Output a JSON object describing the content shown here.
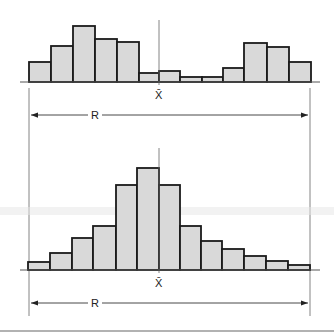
{
  "chart_data": [
    {
      "type": "bar",
      "title": "",
      "description": "Bimodal histogram with wide spread; mean marker in the center valley",
      "categories": [
        "1",
        "2",
        "3",
        "4",
        "5",
        "6",
        "7",
        "8",
        "9",
        "10",
        "11",
        "12",
        "13"
      ],
      "values": [
        20,
        36,
        56,
        43,
        40,
        9,
        11,
        5,
        5,
        14,
        39,
        35,
        20
      ],
      "bar_edges_px": [
        29,
        51,
        73,
        95,
        117,
        139,
        159,
        180,
        202,
        223,
        244,
        267,
        289,
        311
      ],
      "baseline_px": 82,
      "mean_label": "X̄",
      "mean_x_px": 159,
      "range_label": "R",
      "range_px": [
        29,
        310
      ],
      "xlabel": "",
      "ylabel": ""
    },
    {
      "type": "bar",
      "title": "",
      "description": "Unimodal, right-skewed histogram; same range R",
      "categories": [
        "1",
        "2",
        "3",
        "4",
        "5",
        "6",
        "7",
        "8",
        "9",
        "10",
        "11",
        "12",
        "13"
      ],
      "values": [
        8,
        17,
        32,
        44,
        85,
        102,
        85,
        44,
        29,
        21,
        14,
        9,
        5
      ],
      "bar_edges_px": [
        28,
        50,
        72,
        93,
        116,
        137,
        159,
        180,
        201,
        222,
        244,
        266,
        288,
        310
      ],
      "baseline_px": 270,
      "mean_label": "X̄",
      "mean_x_px": 159,
      "range_label": "R",
      "range_px": [
        29,
        310
      ],
      "xlabel": "",
      "ylabel": ""
    }
  ],
  "labels": {
    "top_mean": "X̄",
    "top_range": "R",
    "bottom_mean": "X̄",
    "bottom_range": "R"
  }
}
